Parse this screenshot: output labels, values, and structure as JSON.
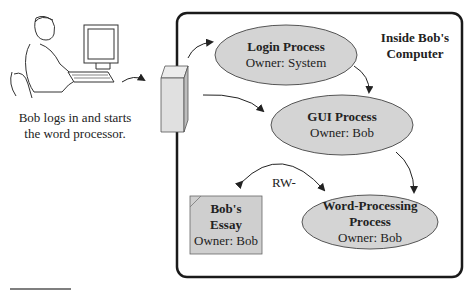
{
  "caption": {
    "line1": "Bob logs in and starts",
    "line2": "the word processor."
  },
  "computer_box": {
    "title_line1": "Inside Bob's",
    "title_line2": "Computer"
  },
  "processes": [
    {
      "name": "Login Process",
      "owner": "Owner: System"
    },
    {
      "name": "GUI Process",
      "owner": "Owner: Bob"
    },
    {
      "name_line1": "Word-Processing",
      "name_line2": "Process",
      "owner": "Owner: Bob"
    }
  ],
  "file": {
    "name_line1": "Bob's",
    "name_line2": "Essay",
    "owner": "Owner: Bob"
  },
  "permission_label": "RW-",
  "colors": {
    "ellipse_fill": "#d4d4d4",
    "file_fill": "#cfcfcf",
    "border": "#1a1a1a"
  }
}
